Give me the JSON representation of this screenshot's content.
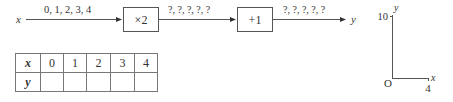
{
  "flow": {
    "input_var": "x",
    "input_values": "0, 1, 2, 3, 4",
    "step1_op": "×2",
    "step1_out": "?, ?, ?, ?, ?",
    "step2_op": "+1",
    "step2_out": "?, ?, ?, ?, ?",
    "output_var": "y"
  },
  "table": {
    "row_headers": [
      "x",
      "y"
    ],
    "x_values": [
      "0",
      "1",
      "2",
      "3",
      "4"
    ],
    "y_values": [
      "",
      "",
      "",
      "",
      ""
    ]
  },
  "axes": {
    "origin_label": "O",
    "x_label": "x",
    "y_label": "y",
    "x_max_tick": "4",
    "y_max_tick": "10"
  }
}
